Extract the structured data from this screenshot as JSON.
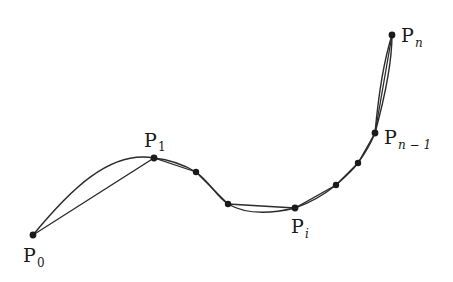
{
  "diagram": {
    "colors": {
      "stroke": "#2b2b2b",
      "point": "#1a1a1a",
      "background": "#ffffff"
    },
    "points": [
      {
        "id": "P0",
        "x": 33,
        "y": 235,
        "label": "P",
        "sub": "0",
        "labeled": true
      },
      {
        "id": "P1",
        "x": 154,
        "y": 158,
        "label": "P",
        "sub": "1",
        "labeled": true
      },
      {
        "id": "Q2",
        "x": 196,
        "y": 172,
        "labeled": false
      },
      {
        "id": "Q3",
        "x": 228,
        "y": 204,
        "labeled": false
      },
      {
        "id": "Pi",
        "x": 295,
        "y": 208,
        "label": "P",
        "sub": "i",
        "labeled": true
      },
      {
        "id": "Q5",
        "x": 336,
        "y": 185,
        "labeled": false
      },
      {
        "id": "Q6",
        "x": 358,
        "y": 163,
        "labeled": false
      },
      {
        "id": "Pn-1",
        "x": 375,
        "y": 133,
        "label": "P",
        "sub": "n−1",
        "labeled": true
      },
      {
        "id": "Pn",
        "x": 392,
        "y": 35,
        "label": "P",
        "sub": "n",
        "labeled": true
      }
    ],
    "labels": {
      "p0": {
        "main": "P",
        "sub": "0"
      },
      "p1": {
        "main": "P",
        "sub": "1"
      },
      "pi": {
        "main": "P",
        "sub": "i"
      },
      "pn1": {
        "main": "P",
        "sub": "n − 1"
      },
      "pn": {
        "main": "P",
        "sub": "n"
      }
    }
  }
}
